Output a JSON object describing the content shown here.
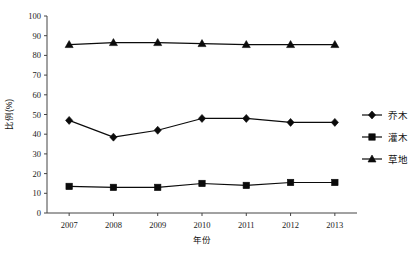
{
  "chart_data": {
    "type": "line",
    "title": "",
    "xlabel": "年份",
    "ylabel": "比例(%)",
    "categories": [
      "2007",
      "2008",
      "2009",
      "2010",
      "2011",
      "2012",
      "2013"
    ],
    "x": [
      2007,
      2008,
      2009,
      2010,
      2011,
      2012,
      2013
    ],
    "ylim": [
      0,
      100
    ],
    "yticks": [
      0,
      10,
      20,
      30,
      40,
      50,
      60,
      70,
      80,
      90,
      100
    ],
    "ytick_labels": [
      "0",
      "10",
      "20",
      "30",
      "40",
      "50",
      "60",
      "70",
      "80",
      "90",
      "100"
    ],
    "grid": false,
    "legend_position": "right",
    "series": [
      {
        "name": "乔木",
        "marker": "diamond",
        "color": "#0b0b0b",
        "values": [
          47,
          38.5,
          42,
          48,
          48,
          46,
          46
        ]
      },
      {
        "name": "灌木",
        "marker": "square",
        "color": "#0b0b0b",
        "values": [
          13.5,
          13,
          13,
          15,
          14,
          15.5,
          15.5
        ]
      },
      {
        "name": "草地",
        "marker": "triangle",
        "color": "#0b0b0b",
        "values": [
          85.5,
          86.5,
          86.5,
          86,
          85.5,
          85.5,
          85.5
        ]
      }
    ]
  },
  "legend": {
    "items": [
      {
        "label": "乔木",
        "marker": "diamond"
      },
      {
        "label": "灌木",
        "marker": "square"
      },
      {
        "label": "草地",
        "marker": "triangle"
      }
    ]
  },
  "axes": {
    "x_title": "年份",
    "y_title": "比例(%)"
  }
}
